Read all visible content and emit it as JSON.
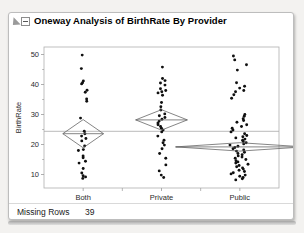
{
  "window": {
    "title": "Oneway Analysis of BirthRate By Provider",
    "disclosure_icon": "disclosure-triangle-icon",
    "collapse_icon": "collapse-box-icon"
  },
  "footer": {
    "label": "Missing Rows",
    "value": "39"
  },
  "colors": {
    "point": "#101010",
    "axis": "#9a9a9a",
    "frame": "#b0b0b0",
    "diamond": "#666666",
    "grand_mean_line": "#a8a8a8",
    "panel_bg": "#ffffff",
    "app_bg": "#f3f2f0"
  },
  "chart_data": {
    "type": "scatter",
    "title": "Oneway Analysis of BirthRate By Provider",
    "xlabel": "Provider",
    "ylabel": "BirthRate",
    "categories": [
      "Both",
      "Private",
      "Public"
    ],
    "yticks": [
      10,
      20,
      30,
      40,
      50
    ],
    "ylim": [
      5.5,
      52.5
    ],
    "grid": false,
    "legend": "none",
    "grand_mean": 24.4,
    "annotations": [
      {
        "text": "Missing Rows",
        "value": "39"
      }
    ],
    "groups": [
      {
        "name": "Both",
        "mean": 23.6,
        "diamond": {
          "center": 23.6,
          "upper": 28.3,
          "lower": 18.9,
          "half_width": 0.26
        },
        "values": [
          49.8,
          45.3,
          41.2,
          40.6,
          40.2,
          38.1,
          37.4,
          35.2,
          34.4,
          28.8,
          24.4,
          23.6,
          22.8,
          22.0,
          21.2,
          19.5,
          18.3,
          18.0,
          16.2,
          15.6,
          14.4,
          13.8,
          12.0,
          10.5,
          9.6,
          9.2,
          8.7
        ]
      },
      {
        "name": "Private",
        "mean": 28.2,
        "diamond": {
          "center": 28.2,
          "upper": 31.6,
          "lower": 24.8,
          "half_width": 0.33
        },
        "values": [
          45.8,
          42.0,
          41.3,
          40.5,
          39.8,
          38.6,
          38.0,
          37.6,
          37.2,
          36.4,
          34.0,
          32.6,
          31.5,
          30.2,
          29.6,
          29.0,
          28.4,
          27.8,
          27.2,
          26.6,
          26.0,
          25.4,
          24.8,
          24.2,
          22.8,
          21.4,
          20.6,
          19.8,
          18.6,
          17.0,
          15.4,
          13.2,
          11.2,
          9.8,
          9.0
        ]
      },
      {
        "name": "Public",
        "mean": 19.2,
        "diamond": {
          "center": 19.2,
          "upper": 20.6,
          "lower": 17.8,
          "half_width": 0.82
        },
        "values": [
          49.5,
          48.2,
          46.6,
          44.8,
          40.6,
          39.4,
          38.8,
          38.0,
          37.6,
          36.6,
          35.4,
          30.0,
          29.4,
          28.6,
          28.0,
          27.4,
          26.6,
          26.0,
          25.4,
          24.8,
          24.2,
          23.6,
          23.0,
          22.6,
          22.2,
          21.8,
          21.4,
          21.0,
          20.6,
          20.2,
          19.8,
          19.4,
          19.0,
          18.6,
          18.2,
          17.8,
          17.4,
          17.0,
          16.6,
          16.2,
          15.8,
          15.4,
          15.0,
          14.6,
          14.2,
          13.8,
          13.4,
          13.0,
          12.6,
          12.2,
          11.8,
          11.4,
          11.0,
          10.6,
          10.2,
          9.8,
          9.4,
          9.0,
          8.6,
          8.2
        ]
      }
    ]
  }
}
